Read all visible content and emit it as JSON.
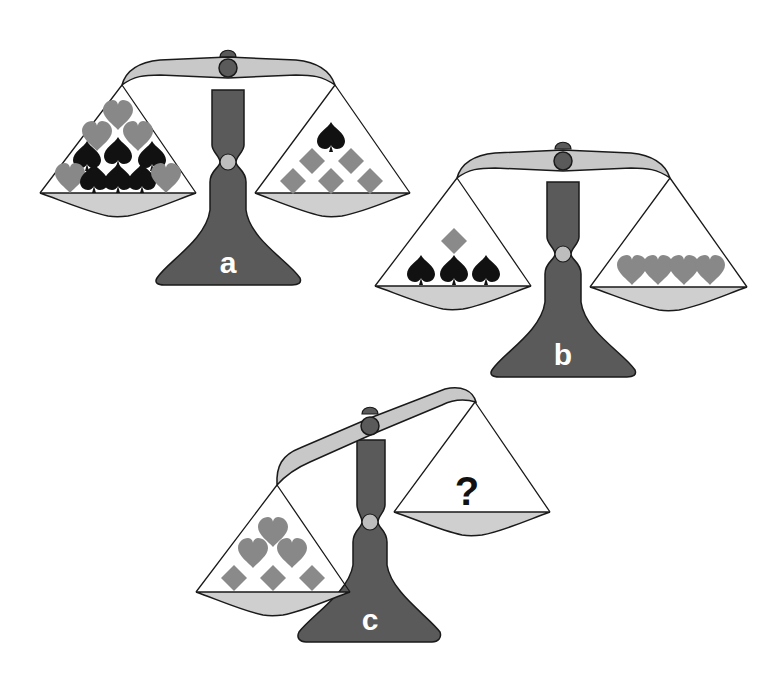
{
  "colors": {
    "background": "#ffffff",
    "beam": "#c8c8c8",
    "pan": "#cfcfcf",
    "stand": "#5a5a5a",
    "outline": "#1a1a1a",
    "collar": "#bdbdbd",
    "heart": "#888888",
    "diamond": "#8a8a8a",
    "spade": "#111111"
  },
  "scales": [
    {
      "id": "a",
      "label": "a",
      "tilt": "balanced",
      "left_pan": {
        "contents": {
          "hearts": 6,
          "spades": 6,
          "diamonds": 0
        }
      },
      "right_pan": {
        "contents": {
          "hearts": 0,
          "spades": 1,
          "diamonds": 5
        }
      }
    },
    {
      "id": "b",
      "label": "b",
      "tilt": "balanced",
      "left_pan": {
        "contents": {
          "hearts": 0,
          "spades": 3,
          "diamonds": 1
        }
      },
      "right_pan": {
        "contents": {
          "hearts": 4,
          "spades": 0,
          "diamonds": 0
        }
      }
    },
    {
      "id": "c",
      "label": "c",
      "tilt": "left-down",
      "left_pan": {
        "contents": {
          "hearts": 3,
          "spades": 0,
          "diamonds": 3
        }
      },
      "right_pan": {
        "contents": "?",
        "unknown_label": "?"
      }
    }
  ]
}
